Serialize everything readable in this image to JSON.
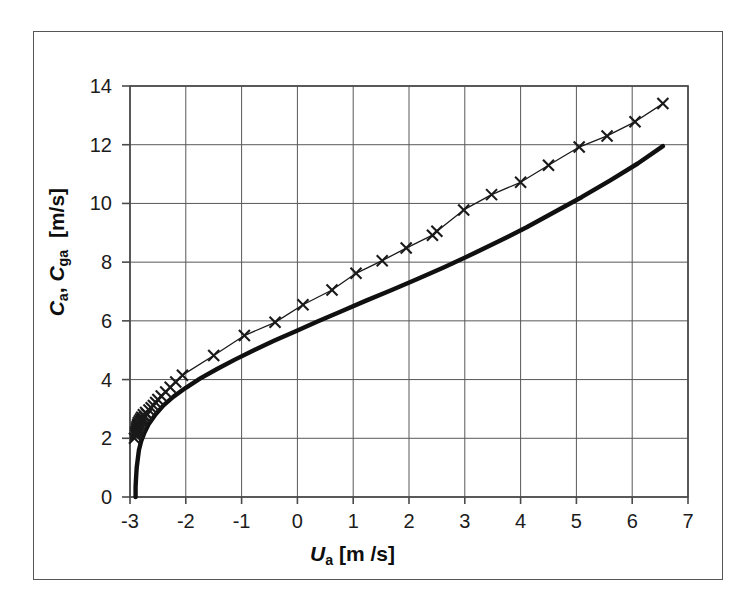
{
  "chart_data": {
    "type": "line",
    "title": "",
    "xlabel": "U a [m /s]",
    "ylabel": "C a, C ga  [m/s]",
    "xlim": [
      -3,
      7
    ],
    "ylim": [
      0,
      14
    ],
    "xticks": [
      "-3",
      "-2",
      "-1",
      "0",
      "1",
      "2",
      "3",
      "4",
      "5",
      "6",
      "7"
    ],
    "yticks": [
      "0",
      "2",
      "4",
      "6",
      "8",
      "10",
      "12",
      "14"
    ],
    "xtick_values": [
      -3,
      -2,
      -1,
      0,
      1,
      2,
      3,
      4,
      5,
      6,
      7
    ],
    "ytick_values": [
      0,
      2,
      4,
      6,
      8,
      10,
      12,
      14
    ],
    "xtick_step": 1,
    "ytick_step": 2,
    "grid": "both",
    "grid_color": "#585858",
    "legend": "none",
    "series": [
      {
        "name": "C_ga",
        "style": "line-with-x-markers",
        "marker": "x",
        "color": "#1a1a1a",
        "line_width": 1.3,
        "marker_size": 11,
        "comment": "upper curve: apparent/ground speed with x markers, dense cluster near x=-2.9",
        "points": [
          [
            -2.92,
            2.0
          ],
          [
            -2.9,
            2.1
          ],
          [
            -2.9,
            2.18
          ],
          [
            -2.89,
            2.24
          ],
          [
            -2.88,
            2.3
          ],
          [
            -2.88,
            2.36
          ],
          [
            -2.87,
            2.42
          ],
          [
            -2.86,
            2.2
          ],
          [
            -2.86,
            2.48
          ],
          [
            -2.85,
            2.3
          ],
          [
            -2.85,
            2.54
          ],
          [
            -2.84,
            2.4
          ],
          [
            -2.83,
            2.6
          ],
          [
            -2.82,
            2.48
          ],
          [
            -2.81,
            2.66
          ],
          [
            -2.8,
            2.56
          ],
          [
            -2.79,
            2.72
          ],
          [
            -2.78,
            2.64
          ],
          [
            -2.76,
            2.8
          ],
          [
            -2.74,
            2.72
          ],
          [
            -2.72,
            2.88
          ],
          [
            -2.7,
            2.82
          ],
          [
            -2.66,
            2.96
          ],
          [
            -2.62,
            3.04
          ],
          [
            -2.58,
            3.12
          ],
          [
            -2.54,
            3.22
          ],
          [
            -2.5,
            3.32
          ],
          [
            -2.44,
            3.44
          ],
          [
            -2.36,
            3.58
          ],
          [
            -2.28,
            3.74
          ],
          [
            -2.18,
            3.92
          ],
          [
            -2.06,
            4.15
          ],
          [
            -1.5,
            4.82
          ],
          [
            -0.95,
            5.5
          ],
          [
            -0.4,
            5.95
          ],
          [
            0.1,
            6.55
          ],
          [
            0.62,
            7.05
          ],
          [
            1.05,
            7.62
          ],
          [
            1.52,
            8.05
          ],
          [
            1.95,
            8.48
          ],
          [
            2.42,
            8.92
          ],
          [
            2.5,
            9.05
          ],
          [
            2.98,
            9.78
          ],
          [
            3.48,
            10.3
          ],
          [
            4.0,
            10.72
          ],
          [
            4.5,
            11.3
          ],
          [
            5.05,
            11.92
          ],
          [
            5.55,
            12.3
          ],
          [
            6.05,
            12.78
          ],
          [
            6.55,
            13.4
          ]
        ]
      },
      {
        "name": "C_a",
        "style": "thick-solid-line",
        "marker": "none",
        "color": "#101010",
        "line_width": 4.4,
        "comment": "lower thick curve starting at (-2.90, 0) rising steeply then merging with upper curve",
        "points": [
          [
            -2.9,
            0.0
          ],
          [
            -2.9,
            0.35
          ],
          [
            -2.89,
            0.7
          ],
          [
            -2.88,
            1.0
          ],
          [
            -2.86,
            1.3
          ],
          [
            -2.84,
            1.6
          ],
          [
            -2.8,
            1.9
          ],
          [
            -2.74,
            2.2
          ],
          [
            -2.66,
            2.5
          ],
          [
            -2.54,
            2.82
          ],
          [
            -2.4,
            3.12
          ],
          [
            -2.22,
            3.42
          ],
          [
            -2.0,
            3.72
          ],
          [
            -1.74,
            4.04
          ],
          [
            -1.44,
            4.36
          ],
          [
            -1.12,
            4.68
          ],
          [
            -0.78,
            5.0
          ],
          [
            -0.42,
            5.32
          ],
          [
            -0.04,
            5.64
          ],
          [
            0.36,
            5.98
          ],
          [
            0.78,
            6.32
          ],
          [
            1.22,
            6.68
          ],
          [
            1.68,
            7.04
          ],
          [
            2.14,
            7.42
          ],
          [
            2.62,
            7.82
          ],
          [
            3.1,
            8.24
          ],
          [
            3.6,
            8.7
          ],
          [
            4.1,
            9.18
          ],
          [
            4.6,
            9.7
          ],
          [
            5.1,
            10.22
          ],
          [
            5.6,
            10.78
          ],
          [
            6.1,
            11.36
          ],
          [
            6.55,
            11.95
          ]
        ]
      }
    ]
  },
  "axes": {
    "xaxis_title_parts": {
      "symbol": "U",
      "subscript": "a",
      "unit": "[m /s]"
    },
    "yaxis_title_parts": {
      "symbol1": "C",
      "subscript1": "a",
      "symbol2": "C",
      "subscript2": "ga",
      "unit": "[m/s]"
    }
  }
}
